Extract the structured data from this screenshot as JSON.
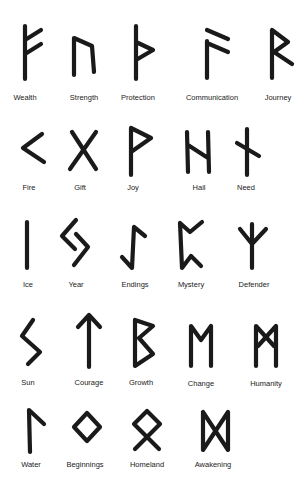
{
  "runes": [
    {
      "name": "Wealth",
      "row": 1
    },
    {
      "name": "Strength",
      "row": 1
    },
    {
      "name": "Protection",
      "row": 1
    },
    {
      "name": "Communication",
      "row": 1
    },
    {
      "name": "Journey",
      "row": 1
    },
    {
      "name": "Fire",
      "row": 2
    },
    {
      "name": "Gift",
      "row": 2
    },
    {
      "name": "Joy",
      "row": 2
    },
    {
      "name": "Hail",
      "row": 2
    },
    {
      "name": "Need",
      "row": 2
    },
    {
      "name": "Ice",
      "row": 3
    },
    {
      "name": "Year",
      "row": 3
    },
    {
      "name": "Endings",
      "row": 3
    },
    {
      "name": "Mystery",
      "row": 3
    },
    {
      "name": "Defender",
      "row": 3
    },
    {
      "name": "Sun",
      "row": 4
    },
    {
      "name": "Courage",
      "row": 4
    },
    {
      "name": "Growth",
      "row": 4
    },
    {
      "name": "Change",
      "row": 4
    },
    {
      "name": "Humanity",
      "row": 4
    },
    {
      "name": "Water",
      "row": 5
    },
    {
      "name": "Beginnings",
      "row": 5
    },
    {
      "name": "Homeland",
      "row": 5
    },
    {
      "name": "Awakening",
      "row": 5
    }
  ],
  "colors": {
    "ink": "#1a1a1a",
    "background": "#ffffff"
  }
}
